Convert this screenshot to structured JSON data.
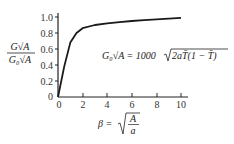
{
  "chart_data": {
    "type": "line",
    "title": "",
    "xlabel": "β = √(A/a)",
    "ylabel": "G√A / G₀√A",
    "annotation": "G₀√A = 1000√(2aT̄(1 − T̄))",
    "xlim": [
      0,
      10
    ],
    "ylim": [
      0,
      1.0
    ],
    "x_ticks": [
      "0",
      "2",
      "4",
      "6",
      "8",
      "10"
    ],
    "y_ticks": [
      "0",
      "0.2",
      "0.4",
      "0.6",
      "0.8",
      "1.0"
    ],
    "grid": false,
    "legend": null,
    "series": [
      {
        "name": "G√A / G₀√A",
        "x": [
          0,
          0.5,
          1.0,
          1.5,
          2.0,
          3.0,
          4.0,
          5.0,
          6.0,
          7.0,
          8.0,
          9.0,
          10.0
        ],
        "values": [
          0,
          0.38,
          0.68,
          0.8,
          0.86,
          0.9,
          0.92,
          0.935,
          0.95,
          0.96,
          0.97,
          0.98,
          0.99
        ]
      }
    ]
  },
  "labels": {
    "y_num": "G√A",
    "y_den": "G₀√A",
    "x_beta": "β =",
    "x_frac_num": "A",
    "x_frac_den": "a",
    "eq_left": "G₀√A = 1000",
    "eq_radicand": "2aT̄(1 − T̄)",
    "y_tick_0": "0",
    "y_tick_1": "0.2",
    "y_tick_2": "0.4",
    "y_tick_3": "0.6",
    "y_tick_4": "0.8",
    "y_tick_5": "1.0",
    "x_tick_0": "0",
    "x_tick_1": "2",
    "x_tick_2": "4",
    "x_tick_3": "6",
    "x_tick_4": "8",
    "x_tick_5": "10"
  }
}
